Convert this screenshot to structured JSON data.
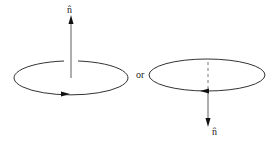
{
  "diagram": {
    "left": {
      "normal_label": "n̂",
      "circulation": "counterclockwise (viewed from above)",
      "normal_direction": "up"
    },
    "connector": "or",
    "right": {
      "normal_label": "n̂",
      "circulation": "clockwise (viewed from above)",
      "normal_direction": "down"
    }
  }
}
